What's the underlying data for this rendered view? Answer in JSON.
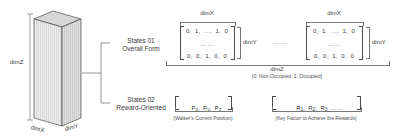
{
  "colors": {
    "ink": "#3a3a3a",
    "line": "#777777",
    "cuboid_face_light": "#ececec",
    "cuboid_face_dark": "#dedede",
    "cuboid_top": "#d7d7d7"
  },
  "diagram": {
    "cuboid": {
      "dim_z_label": "dimZ",
      "dim_x_label": "dimX",
      "dim_y_label": "dimY"
    },
    "states": [
      {
        "line1": "States 01",
        "line2": "Overall Form"
      },
      {
        "line1": "States 02",
        "line2": "Reward-Oriented"
      }
    ],
    "matrix1": {
      "dim_x_label": "dimX",
      "dim_y_label": "dimY",
      "rows": [
        "0,  1,  ...,  1,  0",
        "... ...",
        "0,  0,  1,  0,  0"
      ]
    },
    "matrix2": {
      "dim_x_label": "dimX",
      "dim_y_label": "dimY",
      "rows": [
        "0,  1,  ...,  1,  0",
        "... ...",
        "0,  0,  1,  0,  0"
      ]
    },
    "ellipsis_between": "... ...",
    "dim_z_axis": {
      "label": "dimZ",
      "legend": "(0: Non-Occupied,  1: Occupied)"
    },
    "position_vector": {
      "items": [
        {
          "base": "P",
          "sub": "x",
          "sep": ",  "
        },
        {
          "base": "P",
          "sub": "y",
          "sep": ",  "
        },
        {
          "base": "P",
          "sub": "z",
          "sep": ""
        }
      ],
      "caption": "(Walker's Current Position)"
    },
    "reward_vector": {
      "items": [
        {
          "base": "R",
          "sub": "1",
          "sep": ",  "
        },
        {
          "base": "R",
          "sub": "2",
          "sep": ",  "
        },
        {
          "base": "R",
          "sub": "3",
          "sep": "  "
        }
      ],
      "trailing": "... ...",
      "caption": "(Key Factor to Achieve the Rewards)"
    }
  }
}
